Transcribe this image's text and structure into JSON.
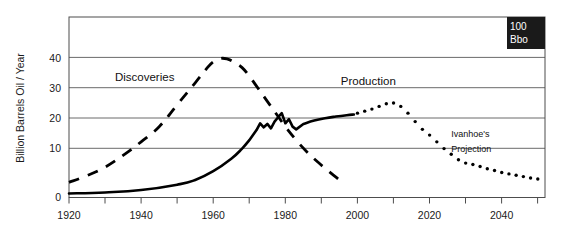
{
  "chart_data": {
    "type": "line",
    "title": "",
    "xlabel": "",
    "ylabel": "Billion Barrels Oil / Year",
    "xlim": [
      1920,
      2052
    ],
    "ylim": [
      0,
      53.5
    ],
    "grid": true,
    "grid_axis": "y",
    "legend": "none",
    "xticks_major": [
      1920,
      1940,
      1960,
      1980,
      2000,
      2020,
      2040
    ],
    "xticks_minor_step": 10,
    "yticks": [
      0,
      10,
      20,
      30,
      40
    ],
    "ytick_labels": [
      "0",
      "10",
      "20",
      "30",
      "40"
    ],
    "xtick_labels": [
      "1920",
      "1940",
      "1960",
      "1980",
      "2000",
      "2020",
      "2040"
    ],
    "annotations": [
      {
        "name": "discoveries",
        "text": "Discoveries",
        "x": 1941,
        "y": 34.5
      },
      {
        "name": "production",
        "text": "Production",
        "x": 2003,
        "y": 33.5
      },
      {
        "name": "ivanhoes-projection",
        "text_line1": "Ivanhoe's",
        "text_line2": "Projection",
        "x": 2026,
        "y": 15.5
      }
    ],
    "badge": {
      "line1": "100",
      "line2": "Bbo"
    },
    "series": [
      {
        "name": "Discoveries",
        "style": "dashed",
        "x": [
          1920,
          1925,
          1930,
          1935,
          1940,
          1945,
          1950,
          1955,
          1958,
          1960,
          1962,
          1964,
          1966,
          1968,
          1970,
          1972,
          1975,
          1978,
          1980,
          1983,
          1986,
          1989,
          1992,
          1995
        ],
        "values": [
          4.5,
          6.5,
          9.0,
          12.5,
          16.5,
          21.0,
          27.5,
          34.0,
          38.0,
          40.2,
          41.2,
          41.0,
          40.0,
          38.5,
          36.0,
          33.0,
          28.5,
          24.0,
          21.0,
          17.0,
          13.5,
          10.5,
          7.8,
          5.2
        ]
      },
      {
        "name": "Production",
        "style": "solid",
        "x": [
          1920,
          1930,
          1940,
          1950,
          1955,
          1960,
          1965,
          1968,
          1970,
          1972,
          1973,
          1974,
          1975,
          1976,
          1977,
          1978,
          1979,
          1980,
          1981,
          1982,
          1983,
          1985,
          1988,
          1991,
          1994,
          1997,
          1999
        ],
        "values": [
          1.2,
          1.5,
          2.2,
          3.8,
          5.2,
          7.8,
          11.5,
          14.5,
          17.0,
          20.0,
          22.0,
          20.8,
          21.8,
          20.5,
          22.5,
          23.8,
          25.0,
          22.0,
          23.2,
          21.0,
          20.2,
          21.8,
          22.8,
          23.5,
          24.0,
          24.4,
          24.6
        ]
      },
      {
        "name": "Ivanhoe's Projection",
        "style": "dotted",
        "x": [
          2000,
          2002,
          2004,
          2006,
          2008,
          2010,
          2012,
          2014,
          2016,
          2018,
          2020,
          2022,
          2024,
          2026,
          2028,
          2030,
          2032,
          2034,
          2036,
          2038,
          2040,
          2042,
          2044,
          2046,
          2048,
          2050
        ],
        "values": [
          25.0,
          25.6,
          26.2,
          27.0,
          27.8,
          28.0,
          27.0,
          25.0,
          22.5,
          20.2,
          18.5,
          16.5,
          14.5,
          12.8,
          11.2,
          10.2,
          9.8,
          9.2,
          8.5,
          8.0,
          7.4,
          7.0,
          6.6,
          6.2,
          5.8,
          5.5
        ]
      }
    ]
  },
  "axis": {
    "y_title": "Billion Barrels Oil / Year"
  }
}
